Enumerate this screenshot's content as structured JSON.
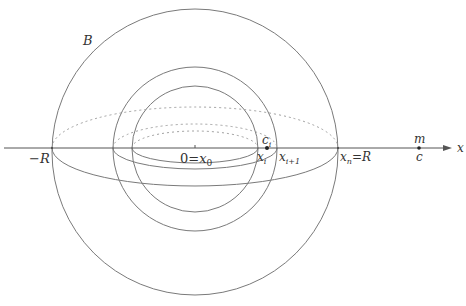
{
  "figure": {
    "labels": {
      "ball": "B",
      "neg_R": "−R",
      "origin": "0",
      "origin_eq": "=",
      "origin_x": "x",
      "origin_sub": "0",
      "xi": "x",
      "xi_sub": "i",
      "xi1": "x",
      "xi1_sub": "i+1",
      "ci": "c",
      "ci_sub": "i",
      "xn": "x",
      "xn_sub": "n",
      "xn_eq": "=",
      "xn_R": "R",
      "mass": "m",
      "point_c": "c",
      "axis": "x"
    },
    "colors": {
      "line": "#7a7a7a",
      "axis": "#555555",
      "dotted": "#a0a0a0",
      "text": "#333333"
    }
  }
}
